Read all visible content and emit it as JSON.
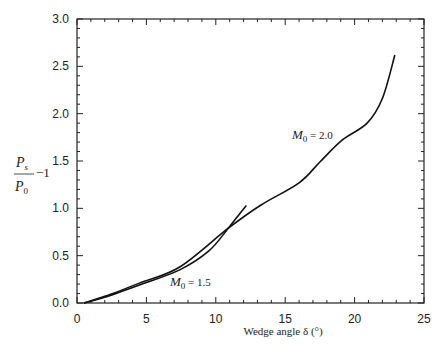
{
  "chart_data": {
    "type": "line",
    "title": "",
    "xlabel": "Wedge angle δ (°)",
    "ylabel": "P_s/P_0 − 1",
    "xlim": [
      0,
      25
    ],
    "ylim": [
      0,
      3.0
    ],
    "xticks": [
      "0",
      "5",
      "10",
      "15",
      "20",
      "25"
    ],
    "yticks": [
      "0.0",
      "0.5",
      "1.0",
      "1.5",
      "2.0",
      "2.5",
      "3.0"
    ],
    "grid": false,
    "legend": "none (inline curve labels)",
    "series": [
      {
        "name": "M0 = 1.5",
        "label": "M₀ = 1.5",
        "x": [
          0.5,
          2,
          4.5,
          7.4,
          9.5,
          10.9,
          11.6,
          12.2
        ],
        "y": [
          0.0,
          0.06,
          0.19,
          0.35,
          0.55,
          0.79,
          0.92,
          1.03
        ]
      },
      {
        "name": "M0 = 2.0",
        "label": "M₀ = 2.0",
        "x": [
          0.5,
          2,
          4.5,
          7.4,
          10.9,
          13.2,
          16.0,
          17.5,
          19.1,
          20.9,
          22.0,
          22.9
        ],
        "y": [
          0.0,
          0.07,
          0.21,
          0.38,
          0.79,
          1.03,
          1.27,
          1.49,
          1.72,
          1.9,
          2.16,
          2.62
        ]
      }
    ],
    "annotations": [
      {
        "text": "M₀ = 2.0",
        "x": 19.0,
        "y": 1.78
      },
      {
        "text": "M₀ = 1.5",
        "x": 7.0,
        "y": 0.22
      }
    ]
  },
  "labels": {
    "ylabel_num": "P",
    "ylabel_num_sub": "s",
    "ylabel_den": "P",
    "ylabel_den_sub": "0",
    "ylabel_suffix": "−1",
    "xlabel": "Wedge angle δ (°)",
    "m2": "M",
    "m2_sub": "0",
    "m2_val": " = 2.0",
    "m15": "M",
    "m15_sub": "0",
    "m15_val": " = 1.5"
  }
}
